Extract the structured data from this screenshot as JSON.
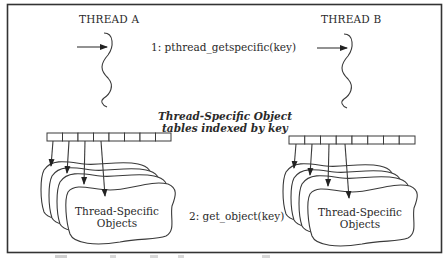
{
  "diagram": {
    "type": "thread-specific-storage",
    "threads": [
      {
        "id": "A",
        "label": "THREAD A"
      },
      {
        "id": "B",
        "label": "THREAD B"
      }
    ],
    "calls": {
      "step1": "1: pthread_getspecific(key)",
      "step2": "2: get_object(key)"
    },
    "tables_label": {
      "line1": "Thread-Specific Object",
      "line2": "tables indexed by key"
    },
    "objects_label": {
      "line1": "Thread-Specific",
      "line2": "Objects"
    },
    "table_cells_per_thread": 8,
    "arrows_per_table": 4,
    "stacked_objects_per_thread": 4,
    "colors": {
      "line": "#3a3a3a",
      "frame": "#333333",
      "background": "#ffffff"
    }
  }
}
